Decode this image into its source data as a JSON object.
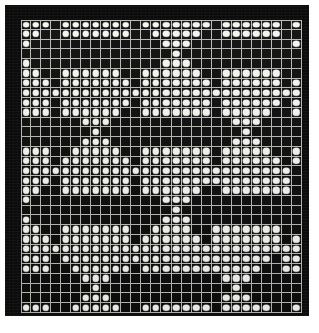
{
  "figure": {
    "frame_color": "#0b0b0b",
    "lattice_line_color": "#b9b9b4",
    "dot_color": "#f4f4f0",
    "cell_background_color": "#0d0d0d",
    "paper_color": "#ffffff"
  },
  "chart_data": {
    "type": "heatmap",
    "subtitle": "",
    "xlabel": "",
    "ylabel": "",
    "columns": 28,
    "rows": 30,
    "legend": [
      {
        "value": 1,
        "label": "dot present (white peg)",
        "color": "#f4f4f0"
      },
      {
        "value": 0,
        "label": "empty cell (dark)",
        "color": "#0d0d0d"
      }
    ],
    "grid": true,
    "legend_position": "none",
    "values": [
      [
        1,
        1,
        1,
        0,
        1,
        1,
        1,
        1,
        1,
        1,
        1,
        0,
        1,
        1,
        1,
        1,
        1,
        1,
        1,
        0,
        1,
        1,
        1,
        1,
        1,
        1,
        0,
        1
      ],
      [
        1,
        1,
        0,
        0,
        1,
        1,
        1,
        1,
        1,
        1,
        1,
        0,
        0,
        1,
        1,
        1,
        1,
        1,
        0,
        0,
        1,
        1,
        1,
        1,
        1,
        1,
        0,
        0
      ],
      [
        1,
        0,
        0,
        0,
        0,
        0,
        0,
        0,
        0,
        0,
        0,
        0,
        0,
        0,
        1,
        1,
        1,
        0,
        0,
        0,
        0,
        0,
        0,
        0,
        0,
        0,
        0,
        1
      ],
      [
        0,
        0,
        0,
        0,
        0,
        0,
        0,
        0,
        0,
        0,
        0,
        0,
        0,
        0,
        0,
        1,
        0,
        0,
        0,
        0,
        0,
        0,
        0,
        0,
        0,
        0,
        0,
        0
      ],
      [
        1,
        0,
        0,
        0,
        0,
        0,
        0,
        0,
        0,
        0,
        0,
        0,
        0,
        0,
        1,
        1,
        1,
        0,
        0,
        0,
        0,
        0,
        0,
        0,
        0,
        0,
        0,
        0
      ],
      [
        1,
        1,
        0,
        0,
        1,
        1,
        1,
        1,
        1,
        1,
        0,
        0,
        1,
        1,
        1,
        1,
        1,
        1,
        0,
        0,
        1,
        1,
        1,
        1,
        1,
        1,
        0,
        0
      ],
      [
        1,
        1,
        1,
        0,
        1,
        1,
        1,
        1,
        1,
        1,
        1,
        0,
        1,
        1,
        1,
        1,
        1,
        1,
        1,
        0,
        1,
        1,
        1,
        1,
        1,
        1,
        0,
        1
      ],
      [
        1,
        1,
        1,
        1,
        1,
        1,
        1,
        1,
        1,
        1,
        1,
        1,
        1,
        1,
        1,
        1,
        1,
        1,
        1,
        1,
        1,
        1,
        1,
        1,
        1,
        1,
        1,
        1
      ],
      [
        1,
        1,
        1,
        0,
        1,
        1,
        1,
        1,
        1,
        1,
        1,
        0,
        1,
        1,
        1,
        1,
        1,
        1,
        1,
        0,
        1,
        1,
        1,
        1,
        1,
        1,
        0,
        1
      ],
      [
        1,
        1,
        1,
        0,
        1,
        1,
        1,
        1,
        1,
        1,
        0,
        0,
        1,
        1,
        1,
        1,
        1,
        1,
        1,
        0,
        1,
        1,
        1,
        1,
        1,
        0,
        0,
        1
      ],
      [
        0,
        0,
        0,
        0,
        0,
        0,
        1,
        1,
        1,
        0,
        0,
        0,
        0,
        0,
        0,
        0,
        0,
        0,
        0,
        0,
        0,
        1,
        1,
        1,
        0,
        0,
        0,
        0
      ],
      [
        0,
        0,
        0,
        0,
        0,
        0,
        0,
        1,
        0,
        0,
        0,
        0,
        0,
        0,
        0,
        0,
        0,
        0,
        0,
        0,
        0,
        0,
        1,
        0,
        0,
        0,
        0,
        0
      ],
      [
        0,
        0,
        0,
        0,
        0,
        0,
        1,
        1,
        1,
        0,
        0,
        0,
        0,
        0,
        0,
        0,
        0,
        0,
        0,
        0,
        0,
        1,
        1,
        1,
        0,
        0,
        0,
        0
      ],
      [
        1,
        1,
        1,
        0,
        0,
        1,
        1,
        1,
        1,
        1,
        0,
        0,
        1,
        1,
        1,
        1,
        1,
        1,
        1,
        0,
        1,
        1,
        1,
        1,
        1,
        0,
        0,
        1
      ],
      [
        1,
        1,
        1,
        0,
        1,
        1,
        1,
        1,
        1,
        1,
        1,
        0,
        1,
        1,
        1,
        1,
        1,
        1,
        1,
        0,
        1,
        1,
        1,
        1,
        1,
        1,
        0,
        1
      ],
      [
        1,
        1,
        1,
        1,
        1,
        1,
        1,
        1,
        1,
        1,
        1,
        1,
        1,
        1,
        1,
        1,
        1,
        1,
        1,
        1,
        1,
        1,
        1,
        1,
        1,
        1,
        1,
        0
      ],
      [
        1,
        1,
        1,
        0,
        1,
        1,
        1,
        1,
        1,
        1,
        1,
        0,
        1,
        1,
        1,
        1,
        1,
        1,
        1,
        1,
        1,
        1,
        1,
        1,
        1,
        1,
        1,
        0
      ],
      [
        1,
        1,
        0,
        0,
        1,
        1,
        1,
        1,
        1,
        1,
        1,
        0,
        1,
        1,
        1,
        1,
        1,
        1,
        0,
        0,
        1,
        1,
        1,
        1,
        1,
        1,
        1,
        0
      ],
      [
        1,
        0,
        0,
        0,
        0,
        0,
        0,
        0,
        0,
        0,
        0,
        0,
        0,
        0,
        1,
        1,
        1,
        0,
        0,
        0,
        0,
        0,
        0,
        0,
        0,
        0,
        0,
        0
      ],
      [
        0,
        0,
        0,
        0,
        0,
        0,
        0,
        0,
        0,
        0,
        0,
        0,
        0,
        0,
        0,
        1,
        0,
        0,
        0,
        0,
        0,
        0,
        0,
        0,
        0,
        0,
        0,
        0
      ],
      [
        1,
        0,
        0,
        0,
        0,
        0,
        0,
        0,
        0,
        0,
        0,
        0,
        0,
        0,
        1,
        1,
        1,
        0,
        0,
        0,
        0,
        0,
        0,
        0,
        0,
        0,
        0,
        0
      ],
      [
        1,
        1,
        0,
        0,
        1,
        1,
        1,
        1,
        1,
        1,
        1,
        0,
        0,
        1,
        1,
        1,
        1,
        0,
        0,
        1,
        1,
        1,
        1,
        1,
        1,
        1,
        0,
        0
      ],
      [
        1,
        1,
        1,
        0,
        1,
        1,
        1,
        1,
        1,
        1,
        1,
        0,
        1,
        1,
        1,
        1,
        1,
        1,
        0,
        1,
        1,
        1,
        1,
        1,
        1,
        1,
        0,
        1
      ],
      [
        1,
        1,
        1,
        1,
        1,
        1,
        1,
        1,
        1,
        1,
        1,
        1,
        1,
        1,
        1,
        1,
        1,
        1,
        1,
        1,
        1,
        1,
        1,
        1,
        1,
        1,
        1,
        1
      ],
      [
        1,
        1,
        1,
        0,
        1,
        1,
        1,
        1,
        1,
        1,
        1,
        1,
        1,
        1,
        1,
        1,
        1,
        1,
        1,
        1,
        1,
        1,
        1,
        1,
        1,
        0,
        1,
        1
      ],
      [
        1,
        1,
        1,
        0,
        0,
        1,
        1,
        1,
        1,
        1,
        1,
        0,
        1,
        1,
        1,
        1,
        1,
        1,
        1,
        1,
        1,
        1,
        1,
        1,
        0,
        0,
        1,
        1
      ],
      [
        0,
        0,
        0,
        0,
        0,
        0,
        1,
        1,
        1,
        0,
        0,
        0,
        0,
        0,
        0,
        0,
        0,
        0,
        0,
        0,
        1,
        1,
        1,
        0,
        0,
        0,
        0,
        0
      ],
      [
        0,
        0,
        0,
        0,
        0,
        0,
        0,
        1,
        0,
        0,
        0,
        0,
        0,
        0,
        0,
        0,
        0,
        0,
        0,
        0,
        0,
        1,
        0,
        0,
        0,
        0,
        0,
        0
      ],
      [
        0,
        0,
        0,
        0,
        0,
        0,
        1,
        1,
        1,
        0,
        0,
        0,
        0,
        0,
        0,
        0,
        0,
        0,
        0,
        0,
        1,
        1,
        1,
        0,
        0,
        0,
        0,
        0
      ],
      [
        1,
        1,
        1,
        0,
        0,
        1,
        1,
        1,
        1,
        1,
        0,
        0,
        1,
        1,
        1,
        1,
        1,
        1,
        1,
        0,
        1,
        1,
        1,
        1,
        1,
        0,
        0,
        1
      ]
    ]
  }
}
